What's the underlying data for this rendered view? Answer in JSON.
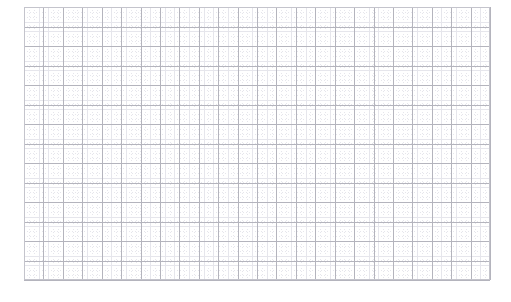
{
  "figure": {
    "width": 511,
    "height": 302,
    "background_color": "#ffffff",
    "title": "",
    "subtitle": ""
  },
  "plot_area": {
    "left": 24,
    "top": 7,
    "width": 466,
    "height": 273,
    "background_color": "#ffffff",
    "border_color": "#c4c4cc",
    "border_width": 1
  },
  "grid": {
    "major": {
      "visible": true,
      "color": "#b4b4bd",
      "line_style": "solid",
      "line_width": 1,
      "spacing_x": 19.42,
      "spacing_y": 19.5,
      "columns": 24,
      "rows": 14
    },
    "minor": {
      "visible": true,
      "color": "#e6e6ec",
      "line_style": "dotted",
      "line_width": 1,
      "subdivisions": 4,
      "spacing_x": 4.854,
      "spacing_y": 4.875
    }
  },
  "axes": {
    "xlabel": "",
    "ylabel": "",
    "x_tick_labels": [],
    "y_tick_labels": [],
    "ticks_visible": false
  },
  "legend": {
    "visible": false,
    "position": "none",
    "entries": []
  },
  "chart_data": {
    "type": "line",
    "title": "",
    "subtitle": "",
    "xlabel": "",
    "ylabel": "",
    "x": [],
    "series": [],
    "categories": [],
    "values": [],
    "annotations": [],
    "xlim": [
      0,
      24
    ],
    "ylim": [
      0,
      14
    ],
    "grid": true,
    "legend_position": "none",
    "note": "Empty graph-paper style plot: grid only, no plotted data, no tick labels, no legend."
  }
}
